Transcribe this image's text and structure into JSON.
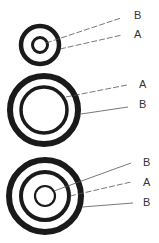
{
  "diagram": {
    "ring_color": "#1a1a1a",
    "line_color": "#555555",
    "label_color": "#333333",
    "figures": [
      {
        "id": "figure-1",
        "description": "Thick outer ring with small inner ring",
        "labels": [
          {
            "text": "B",
            "target": "inner-ring"
          },
          {
            "text": "A",
            "target": "outer-ring"
          }
        ]
      },
      {
        "id": "figure-2",
        "description": "Thick outer ring with large inner ring",
        "labels": [
          {
            "text": "A",
            "target": "inner-ring"
          },
          {
            "text": "B",
            "target": "outer-ring"
          }
        ]
      },
      {
        "id": "figure-3",
        "description": "Three concentric rings",
        "labels": [
          {
            "text": "B",
            "target": "inner-ring"
          },
          {
            "text": "A",
            "target": "middle-ring"
          },
          {
            "text": "B",
            "target": "outer-ring"
          }
        ]
      }
    ]
  }
}
